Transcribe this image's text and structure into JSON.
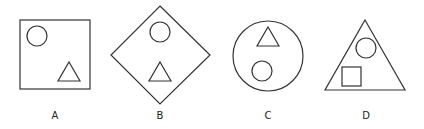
{
  "figures": [
    {
      "id": "A",
      "label": "A",
      "outer_shape": "square",
      "inner_shapes": [
        "circle (top-left)",
        "triangle (bottom-right)"
      ]
    },
    {
      "id": "B",
      "label": "B",
      "outer_shape": "diamond",
      "inner_shapes": [
        "circle (top)",
        "triangle (bottom)"
      ]
    },
    {
      "id": "C",
      "label": "C",
      "outer_shape": "circle",
      "inner_shapes": [
        "triangle (top)",
        "circle (bottom)"
      ]
    },
    {
      "id": "D",
      "label": "D",
      "outer_shape": "triangle",
      "inner_shapes": [
        "circle (top)",
        "square (bottom-left)"
      ]
    }
  ],
  "colors": {
    "stroke": "#333333",
    "background": "#ffffff"
  }
}
